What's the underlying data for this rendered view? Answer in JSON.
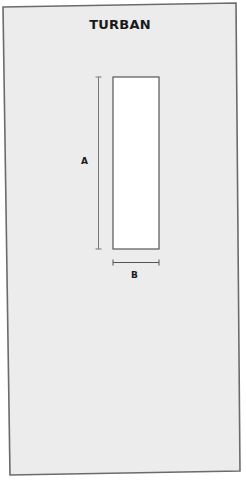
{
  "diagram": {
    "title": "TURBAN",
    "panel_color": "#ececec",
    "border_color": "#6b6b6b",
    "pattern_piece": {
      "shape": "rectangle",
      "fill": "#ffffff",
      "stroke": "#555555"
    },
    "dimensions": [
      {
        "label": "A",
        "orientation": "vertical",
        "describes": "length"
      },
      {
        "label": "B",
        "orientation": "horizontal",
        "describes": "width"
      }
    ]
  }
}
